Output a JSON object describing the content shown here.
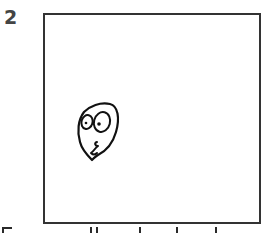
{
  "panel": {
    "number": "2",
    "frame_color": "#333333",
    "number_color": "#444444"
  },
  "drawing": {
    "subject": "face-doodle",
    "description": "hand-drawn egg-shaped face with two round eyes and a squiggly mouth"
  },
  "caption": {
    "visible": false,
    "note": "clipped at bottom edge; only tops of letters visible"
  }
}
